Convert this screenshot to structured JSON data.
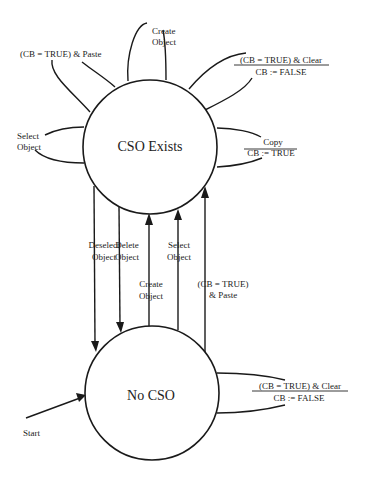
{
  "diagram": {
    "type": "state-transition",
    "states": {
      "cso_exists": {
        "label": "CSO Exists"
      },
      "no_cso": {
        "label": "No CSO"
      }
    },
    "start_label": "Start",
    "self_loops_cso_exists": {
      "paste": {
        "label": "(CB = TRUE) & Paste"
      },
      "create": {
        "line1": "Create",
        "line2": "Object"
      },
      "clear": {
        "condition": "(CB = TRUE) & Clear",
        "action": "CB := FALSE"
      },
      "select": {
        "line1": "Select",
        "line2": "Object"
      },
      "copy": {
        "condition": "Copy",
        "action": "CB := TRUE"
      }
    },
    "transitions_down": {
      "deselect": {
        "line1": "Deselect",
        "line2": "Object"
      },
      "delete": {
        "line1": "Delete",
        "line2": "Object"
      }
    },
    "transitions_up": {
      "create": {
        "line1": "Create",
        "line2": "Object"
      },
      "select": {
        "line1": "Select",
        "line2": "Object"
      },
      "paste": {
        "line1": "(CB = TRUE)",
        "line2": "& Paste"
      }
    },
    "self_loops_no_cso": {
      "clear": {
        "condition": "(CB = TRUE) & Clear",
        "action": "CB := FALSE"
      }
    }
  }
}
